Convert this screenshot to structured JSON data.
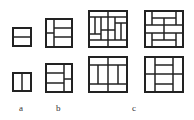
{
  "labels": {
    "a": "a",
    "b": "b",
    "c": "c"
  },
  "colors": {
    "stroke": "#222222",
    "background": "#ffffff",
    "label": "#333333"
  },
  "figures": [
    {
      "id": "a-top",
      "group": "a",
      "box": [
        13,
        28,
        18,
        18
      ],
      "lines": [
        [
          13,
          37,
          31,
          37
        ]
      ]
    },
    {
      "id": "a-bottom",
      "group": "a",
      "box": [
        13,
        73,
        18,
        18
      ],
      "lines": [
        [
          22,
          73,
          22,
          91
        ]
      ]
    },
    {
      "id": "b-top",
      "group": "b",
      "box": [
        46,
        19,
        26,
        28
      ],
      "lines": [
        [
          54,
          19,
          54,
          47
        ],
        [
          46,
          33,
          54,
          33
        ],
        [
          54,
          28,
          72,
          28
        ],
        [
          54,
          37,
          72,
          37
        ]
      ]
    },
    {
      "id": "b-bottom",
      "group": "b",
      "box": [
        46,
        64,
        26,
        28
      ],
      "lines": [
        [
          64,
          64,
          64,
          92
        ],
        [
          46,
          73,
          64,
          73
        ],
        [
          46,
          83,
          64,
          83
        ],
        [
          64,
          79,
          72,
          79
        ]
      ]
    },
    {
      "id": "c-top-1",
      "group": "c",
      "box": [
        89,
        11,
        38,
        36
      ],
      "lines": [
        [
          89,
          17,
          127,
          17
        ],
        [
          89,
          40,
          127,
          40
        ],
        [
          101,
          17,
          101,
          40
        ],
        [
          115,
          17,
          115,
          40
        ],
        [
          101,
          30,
          115,
          30
        ],
        [
          108,
          11,
          108,
          30
        ],
        [
          108,
          30,
          108,
          47
        ],
        [
          95,
          17,
          95,
          34
        ],
        [
          89,
          34,
          101,
          34
        ],
        [
          121,
          23,
          121,
          40
        ],
        [
          115,
          23,
          127,
          23
        ]
      ]
    },
    {
      "id": "c-top-2",
      "group": "c",
      "box": [
        145,
        11,
        38,
        36
      ],
      "lines": [
        [
          152,
          11,
          152,
          25
        ],
        [
          176,
          11,
          176,
          25
        ],
        [
          152,
          18,
          176,
          18
        ],
        [
          145,
          25,
          183,
          25
        ],
        [
          145,
          33,
          183,
          33
        ],
        [
          164,
          18,
          164,
          33
        ],
        [
          152,
          33,
          152,
          47
        ],
        [
          176,
          33,
          176,
          47
        ],
        [
          152,
          40,
          176,
          40
        ],
        [
          164,
          33,
          164,
          40
        ]
      ]
    },
    {
      "id": "c-bottom-1",
      "group": "c",
      "box": [
        89,
        57,
        38,
        35
      ],
      "lines": [
        [
          89,
          65,
          127,
          65
        ],
        [
          89,
          84,
          127,
          84
        ],
        [
          108,
          57,
          108,
          92
        ],
        [
          98,
          65,
          98,
          84
        ],
        [
          118,
          65,
          118,
          84
        ]
      ]
    },
    {
      "id": "c-bottom-2",
      "group": "c",
      "box": [
        145,
        57,
        38,
        35
      ],
      "lines": [
        [
          155,
          57,
          155,
          92
        ],
        [
          173,
          57,
          173,
          92
        ],
        [
          145,
          74,
          183,
          74
        ],
        [
          155,
          65,
          173,
          65
        ],
        [
          155,
          84,
          173,
          84
        ]
      ]
    }
  ]
}
